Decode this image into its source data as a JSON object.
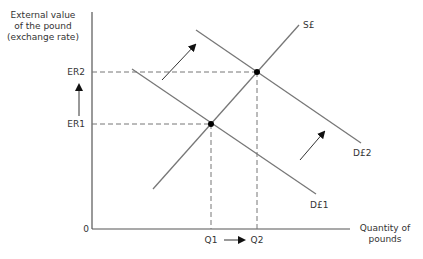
{
  "diagram": {
    "title": "",
    "y_axis_label": [
      "External value",
      "of the pound",
      "(exchange rate)"
    ],
    "x_axis_label": [
      "Quantity of",
      "pounds"
    ],
    "origin_label": "0",
    "y_ticks": [
      {
        "label": "ER2",
        "y": 72
      },
      {
        "label": "ER1",
        "y": 124
      }
    ],
    "x_ticks": [
      {
        "label": "Q1",
        "x": 211
      },
      {
        "label": "Q2",
        "x": 257
      }
    ],
    "curves": [
      {
        "name": "S£",
        "type": "supply",
        "from": [
          153,
          189
        ],
        "to": [
          299,
          25
        ]
      },
      {
        "name": "D£1",
        "type": "demand",
        "from": [
          132,
          69
        ],
        "to": [
          316,
          194
        ]
      },
      {
        "name": "D£2",
        "type": "demand",
        "from": [
          196,
          30
        ],
        "to": [
          361,
          143
        ]
      }
    ],
    "equilibria": [
      {
        "name": "E1",
        "x": 211,
        "y": 124,
        "price": "ER1",
        "quantity": "Q1"
      },
      {
        "name": "E2",
        "x": 257,
        "y": 72,
        "price": "ER2",
        "quantity": "Q2"
      }
    ],
    "shift_arrows": [
      {
        "from": [
          162,
          80
        ],
        "to": [
          196,
          44
        ]
      },
      {
        "from": [
          300,
          160
        ],
        "to": [
          325,
          131
        ]
      }
    ],
    "annotations": {
      "price_rise_arrow": "ER1 → ER2",
      "quantity_rise_arrow": "Q1 → Q2"
    },
    "colors": {
      "axis": "#555555",
      "curve": "#777777",
      "dash": "#777777",
      "point": "#000000",
      "text": "#333333"
    }
  }
}
